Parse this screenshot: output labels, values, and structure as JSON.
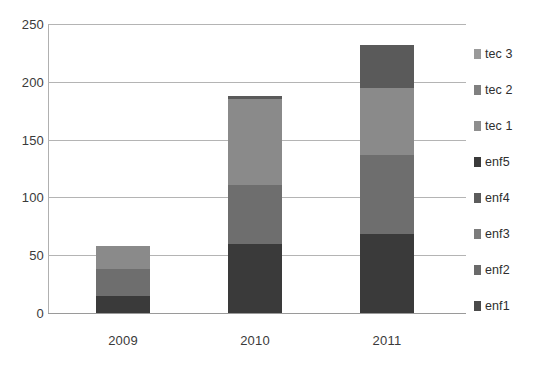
{
  "chart_data": {
    "type": "bar",
    "subtype": "stacked-bar",
    "title": "",
    "xlabel": "",
    "ylabel": "",
    "categories": [
      "2009",
      "2010",
      "2011"
    ],
    "ylim": [
      0,
      250
    ],
    "yticks": [
      0,
      50,
      100,
      150,
      200,
      250
    ],
    "ytick_labels": [
      "0",
      "50",
      "100",
      "150",
      "200",
      "250"
    ],
    "grid": true,
    "legend_position": "right",
    "stack_order_bottom_to_top": [
      "enf1",
      "enf2",
      "enf3",
      "enf4",
      "enf5",
      "tec 1",
      "tec 2",
      "tec 3"
    ],
    "totals": [
      58,
      188,
      232
    ],
    "series": [
      {
        "name": "enf1",
        "color": "#3a3a3a",
        "values": [
          15,
          60,
          68
        ]
      },
      {
        "name": "enf2",
        "color": "#4a4a4a",
        "values": [
          0,
          0,
          0
        ]
      },
      {
        "name": "enf3",
        "color": "#6e6e6e",
        "values": [
          23,
          51,
          69
        ]
      },
      {
        "name": "enf4",
        "color": "#606060",
        "values": [
          0,
          0,
          0
        ]
      },
      {
        "name": "enf5",
        "color": "#333333",
        "values": [
          0,
          0,
          0
        ]
      },
      {
        "name": "tec 1",
        "color": "#8a8a8a",
        "values": [
          20,
          74,
          58
        ]
      },
      {
        "name": "tec 2",
        "color": "#7a7a7a",
        "values": [
          0,
          0,
          0
        ]
      },
      {
        "name": "tec 3",
        "color": "#5a5a5a",
        "values": [
          0,
          3,
          37
        ]
      }
    ],
    "legend_entries": [
      {
        "label": "tec 3",
        "color": "#9a9a9a"
      },
      {
        "label": "tec 2",
        "color": "#808080"
      },
      {
        "label": "tec 1",
        "color": "#8e8e8e"
      },
      {
        "label": "enf5",
        "color": "#3a3a3a"
      },
      {
        "label": "enf4",
        "color": "#5c5c5c"
      },
      {
        "label": "enf3",
        "color": "#7c7c7c"
      },
      {
        "label": "enf2",
        "color": "#6a6a6a"
      },
      {
        "label": "enf1",
        "color": "#4a4a4a"
      }
    ],
    "bars": [
      {
        "category": "2009",
        "total": 58,
        "segments": [
          {
            "name": "enf1",
            "value": 15,
            "color": "#3a3a3a"
          },
          {
            "name": "enf3",
            "value": 23,
            "color": "#6e6e6e"
          },
          {
            "name": "tec 1",
            "value": 20,
            "color": "#8a8a8a"
          }
        ]
      },
      {
        "category": "2010",
        "total": 188,
        "segments": [
          {
            "name": "enf1",
            "value": 60,
            "color": "#3a3a3a"
          },
          {
            "name": "enf3",
            "value": 51,
            "color": "#6e6e6e"
          },
          {
            "name": "tec 1",
            "value": 74,
            "color": "#8a8a8a"
          },
          {
            "name": "tec 3",
            "value": 3,
            "color": "#5a5a5a"
          }
        ]
      },
      {
        "category": "2011",
        "total": 232,
        "segments": [
          {
            "name": "enf1",
            "value": 68,
            "color": "#3a3a3a"
          },
          {
            "name": "enf3",
            "value": 69,
            "color": "#6e6e6e"
          },
          {
            "name": "tec 1",
            "value": 58,
            "color": "#8a8a8a"
          },
          {
            "name": "tec 3",
            "value": 37,
            "color": "#5a5a5a"
          }
        ]
      }
    ]
  },
  "axis": {
    "y_labels": [
      "250",
      "200",
      "150",
      "100",
      "50",
      "0"
    ],
    "x_labels": [
      "2009",
      "2010",
      "2011"
    ]
  },
  "legend": {
    "items": [
      {
        "label": "tec 3"
      },
      {
        "label": "tec 2"
      },
      {
        "label": "tec 1"
      },
      {
        "label": "enf5"
      },
      {
        "label": "enf4"
      },
      {
        "label": "enf3"
      },
      {
        "label": "enf2"
      },
      {
        "label": "enf1"
      }
    ]
  }
}
